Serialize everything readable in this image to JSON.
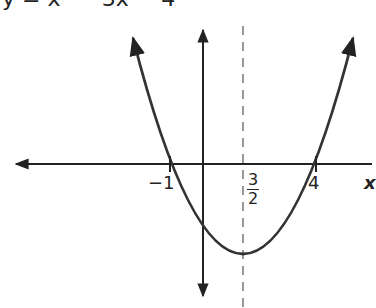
{
  "equation_partial": "y = x² − 3x − 4",
  "axis": {
    "x_label_partial": "x"
  },
  "labels": {
    "root_left": "−1",
    "root_right": "4",
    "axis_of_symmetry_num": "3",
    "axis_of_symmetry_den": "2"
  },
  "colors": {
    "curve": "#333333",
    "axis": "#222222",
    "dashed": "#999999"
  },
  "graph": {
    "type": "parabola",
    "roots": [
      -1,
      4
    ],
    "axis_of_symmetry": 1.5,
    "opens": "up"
  }
}
